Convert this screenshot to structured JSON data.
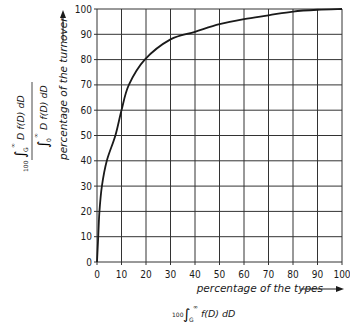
{
  "chart_data": {
    "type": "line",
    "title": "",
    "xlabel": "percentage of the types",
    "ylabel": "percentage of the turnover",
    "xlabel_formula": "100 ∫_G^∞ f(D) dD",
    "ylabel_formula": "100 ∫_G^∞ D f(D) dD / ∫_0^∞ D f(D) dD",
    "xlim": [
      0,
      100
    ],
    "ylim": [
      0,
      100
    ],
    "grid": true,
    "x_ticks": [
      0,
      10,
      20,
      30,
      40,
      50,
      60,
      70,
      80,
      90,
      100
    ],
    "y_ticks": [
      0,
      10,
      20,
      30,
      40,
      50,
      60,
      70,
      80,
      90,
      100
    ],
    "series": [
      {
        "name": "turnover vs types",
        "x": [
          0,
          0.5,
          1,
          2,
          4,
          7.5,
          10,
          13,
          19.5,
          30,
          40,
          50,
          60,
          70,
          80,
          90,
          100
        ],
        "y": [
          0,
          10,
          20,
          30,
          40,
          50,
          60,
          70,
          80,
          88,
          91,
          94,
          96,
          97.5,
          99,
          99.7,
          100
        ]
      }
    ]
  },
  "labels": {
    "x_axis": "percentage of the types",
    "y_axis": "percentage of the turnover",
    "x_formula_prefix": "100",
    "x_formula_lower": "G",
    "x_formula_upper": "∞",
    "x_formula_body": "f(D) dD",
    "y_formula_prefix": "100",
    "y_num_lower": "G",
    "y_num_upper": "∞",
    "y_num_body": "D f(D) dD",
    "y_den_lower": "0",
    "y_den_upper": "∞",
    "y_den_body": "D f(D) dD"
  },
  "colors": {
    "line": "#1a1a1a",
    "grid": "#333333",
    "background": "#ffffff"
  }
}
